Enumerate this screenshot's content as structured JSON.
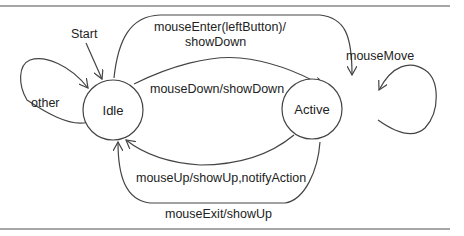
{
  "diagram": {
    "type": "state-machine",
    "start_label": "Start",
    "states": [
      {
        "id": "idle",
        "label": "Idle"
      },
      {
        "id": "active",
        "label": "Active"
      }
    ],
    "transitions": [
      {
        "from": "idle",
        "to": "idle",
        "label": "other"
      },
      {
        "from": "idle",
        "to": "active",
        "label_line1": "mouseEnter(leftButton)/",
        "label_line2": "showDown"
      },
      {
        "from": "idle",
        "to": "active",
        "label": "mouseDown/showDown"
      },
      {
        "from": "active",
        "to": "active",
        "label": "mouseMove"
      },
      {
        "from": "active",
        "to": "idle",
        "label": "mouseUp/showUp,notifyAction"
      },
      {
        "from": "active",
        "to": "idle",
        "label": "mouseExit/showUp"
      }
    ]
  }
}
